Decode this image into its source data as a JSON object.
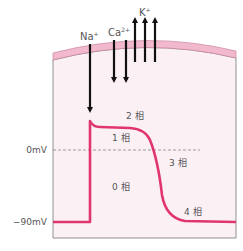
{
  "diagram": {
    "ions": {
      "na": "Na",
      "na_sup": "+",
      "ca": "Ca",
      "ca_sup": "2+",
      "k": "K",
      "k_sup": "+"
    },
    "axis": {
      "zero": "0mV",
      "resting": "−90mV"
    },
    "phases": {
      "p0": "0 相",
      "p1": "1 相",
      "p2": "2 相",
      "p3": "3 相",
      "p4": "4 相"
    },
    "colors": {
      "curve": "#e0356f",
      "membrane": "#f2b8cd",
      "membrane_edge": "#c9859f",
      "cell_fill": "#fbf1f5",
      "arrow": "#111111",
      "text": "#555555",
      "dashed": "#888888"
    }
  }
}
